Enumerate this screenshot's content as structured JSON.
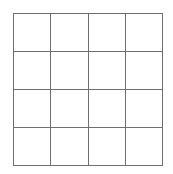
{
  "page": {
    "background_color": "#ffffff",
    "width": 173,
    "height": 174
  },
  "grid": {
    "name": "empty-grid",
    "rows": 4,
    "columns": 4,
    "line_color": "#6e6e6e",
    "line_width_px": 1,
    "cell_fill_color": "#ffffff",
    "bounds": {
      "left": 13,
      "top": 13,
      "width": 150,
      "height": 153
    },
    "cells": [
      {
        "row": 1,
        "column": 1,
        "label": ""
      },
      {
        "row": 1,
        "column": 2,
        "label": ""
      },
      {
        "row": 1,
        "column": 3,
        "label": ""
      },
      {
        "row": 1,
        "column": 4,
        "label": ""
      },
      {
        "row": 2,
        "column": 1,
        "label": ""
      },
      {
        "row": 2,
        "column": 2,
        "label": ""
      },
      {
        "row": 2,
        "column": 3,
        "label": ""
      },
      {
        "row": 2,
        "column": 4,
        "label": ""
      },
      {
        "row": 3,
        "column": 1,
        "label": ""
      },
      {
        "row": 3,
        "column": 2,
        "label": ""
      },
      {
        "row": 3,
        "column": 3,
        "label": ""
      },
      {
        "row": 3,
        "column": 4,
        "label": ""
      },
      {
        "row": 4,
        "column": 1,
        "label": ""
      },
      {
        "row": 4,
        "column": 2,
        "label": ""
      },
      {
        "row": 4,
        "column": 3,
        "label": ""
      },
      {
        "row": 4,
        "column": 4,
        "label": ""
      }
    ]
  }
}
